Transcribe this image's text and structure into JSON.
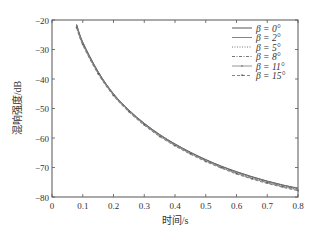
{
  "chart_data": {
    "type": "line",
    "title": "",
    "xlabel": "时间/s",
    "ylabel": "混响强度/dB",
    "xlim": [
      0,
      0.8
    ],
    "ylim": [
      -80,
      -20
    ],
    "xticks": [
      0,
      0.1,
      0.2,
      0.3,
      0.4,
      0.5,
      0.6,
      0.7,
      0.8
    ],
    "xtick_labels": [
      "0",
      "0.1",
      "0.2",
      "0.3",
      "0.4",
      "0.5",
      "0.6",
      "0.7",
      "0.8"
    ],
    "yticks": [
      -80,
      -70,
      -60,
      -50,
      -40,
      -30,
      -20
    ],
    "ytick_labels": [
      "−80",
      "−70",
      "−60",
      "−50",
      "−40",
      "−30",
      "−20"
    ],
    "grid": false,
    "legend_position": "upper right",
    "x": [
      0.08,
      0.1,
      0.15,
      0.2,
      0.25,
      0.3,
      0.35,
      0.4,
      0.45,
      0.5,
      0.55,
      0.6,
      0.65,
      0.7,
      0.75,
      0.8
    ],
    "series": [
      {
        "name": "β = 0°",
        "style": "solid",
        "values": [
          -21.5,
          -27.5,
          -37.5,
          -45.0,
          -50.5,
          -55.0,
          -58.8,
          -62.0,
          -64.8,
          -67.3,
          -69.5,
          -71.4,
          -73.1,
          -74.6,
          -75.9,
          -77.0
        ]
      },
      {
        "name": "β = 2°",
        "style": "solid-light",
        "values": [
          -21.6,
          -27.6,
          -37.6,
          -45.1,
          -50.6,
          -55.1,
          -58.9,
          -62.1,
          -64.9,
          -67.4,
          -69.6,
          -71.5,
          -73.2,
          -74.7,
          -76.0,
          -77.1
        ]
      },
      {
        "name": "β = 5°",
        "style": "dotted",
        "values": [
          -21.8,
          -27.8,
          -37.7,
          -45.2,
          -50.7,
          -55.2,
          -59.0,
          -62.2,
          -65.0,
          -67.5,
          -69.7,
          -71.6,
          -73.3,
          -74.8,
          -76.1,
          -77.2
        ]
      },
      {
        "name": "β = 8°",
        "style": "dash-dot",
        "values": [
          -22.0,
          -28.0,
          -37.9,
          -45.3,
          -50.8,
          -55.3,
          -59.1,
          -62.3,
          -65.1,
          -67.6,
          -69.8,
          -71.8,
          -73.5,
          -75.0,
          -76.3,
          -77.4
        ]
      },
      {
        "name": "β = 11°",
        "style": "solid-dot-marker",
        "values": [
          -22.3,
          -28.2,
          -38.1,
          -45.5,
          -51.0,
          -55.5,
          -59.3,
          -62.5,
          -65.3,
          -67.8,
          -70.0,
          -72.0,
          -73.7,
          -75.2,
          -76.5,
          -77.6
        ]
      },
      {
        "name": "β = 15°",
        "style": "dash-star-marker",
        "values": [
          -22.6,
          -28.5,
          -38.3,
          -45.7,
          -51.2,
          -55.7,
          -59.5,
          -62.7,
          -65.5,
          -68.0,
          -70.2,
          -72.2,
          -73.9,
          -75.4,
          -76.7,
          -77.9
        ]
      }
    ]
  },
  "legend": {
    "items": [
      {
        "label": "β = 0°"
      },
      {
        "label": "β = 2°"
      },
      {
        "label": "β = 5°"
      },
      {
        "label": "β = 8°"
      },
      {
        "label": "β = 11°"
      },
      {
        "label": "β = 15°"
      }
    ]
  },
  "axes": {
    "xlabel": "时间/s",
    "ylabel": "混响强度/dB"
  }
}
